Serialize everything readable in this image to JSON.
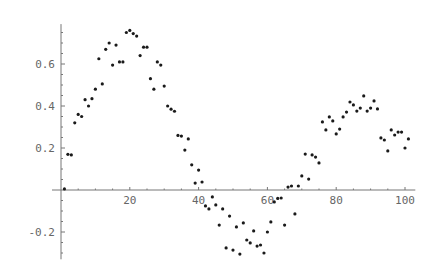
{
  "chart_data": {
    "type": "scatter",
    "title": "",
    "xlabel": "",
    "ylabel": "",
    "xlim": [
      0,
      103
    ],
    "ylim": [
      -0.33,
      0.79
    ],
    "grid": false,
    "legend": null,
    "x_ticks": [
      20,
      40,
      60,
      80,
      100
    ],
    "x_tick_labels": [
      "20",
      "40",
      "60",
      "80",
      "100"
    ],
    "y_ticks": [
      -0.2,
      0.2,
      0.4,
      0.6
    ],
    "y_tick_labels": [
      "-0.2",
      "0.2",
      "0.4",
      "0.6"
    ],
    "point_color": "#1a1a1a",
    "axis_color": "#777777",
    "series": [
      {
        "name": "data",
        "x": [
          1,
          2,
          3,
          4,
          5,
          6,
          7,
          8,
          9,
          10,
          11,
          12,
          13,
          14,
          15,
          16,
          17,
          18,
          19,
          20,
          21,
          22,
          23,
          24,
          25,
          26,
          27,
          28,
          29,
          30,
          31,
          32,
          33,
          34,
          35,
          36,
          37,
          38,
          39,
          40,
          41,
          42,
          43,
          44,
          45,
          46,
          47,
          48,
          49,
          50,
          51,
          52,
          53,
          54,
          55,
          56,
          57,
          58,
          59,
          60,
          61,
          62,
          63,
          64,
          65,
          66,
          67,
          68,
          69,
          70,
          71,
          72,
          73,
          74,
          75,
          76,
          77,
          78,
          79,
          80,
          81,
          82,
          83,
          84,
          85,
          86,
          87,
          88,
          89,
          90,
          91,
          92,
          93,
          94,
          95,
          96,
          97,
          98,
          99,
          100,
          101
        ],
        "y": [
          0.005,
          0.17,
          0.167,
          0.32,
          0.36,
          0.35,
          0.43,
          0.4,
          0.435,
          0.48,
          0.625,
          0.505,
          0.67,
          0.7,
          0.595,
          0.69,
          0.61,
          0.61,
          0.75,
          0.76,
          0.745,
          0.733,
          0.64,
          0.68,
          0.68,
          0.53,
          0.48,
          0.61,
          0.595,
          0.495,
          0.4,
          0.385,
          0.375,
          0.26,
          0.257,
          0.19,
          0.243,
          0.12,
          0.033,
          0.095,
          0.038,
          -0.076,
          -0.09,
          -0.033,
          -0.071,
          -0.167,
          -0.09,
          -0.276,
          -0.124,
          -0.286,
          -0.176,
          -0.305,
          -0.157,
          -0.238,
          -0.252,
          -0.195,
          -0.267,
          -0.262,
          -0.3,
          -0.2,
          -0.152,
          -0.057,
          -0.04,
          -0.038,
          -0.167,
          0.014,
          0.019,
          -0.114,
          0.019,
          0.067,
          0.171,
          0.052,
          0.167,
          0.157,
          0.129,
          0.324,
          0.286,
          0.348,
          0.329,
          0.267,
          0.29,
          0.348,
          0.371,
          0.419,
          0.405,
          0.376,
          0.39,
          0.448,
          0.376,
          0.39,
          0.424,
          0.386,
          0.248,
          0.238,
          0.186,
          0.286,
          0.262,
          0.276,
          0.276,
          0.2,
          0.243
        ]
      }
    ]
  }
}
